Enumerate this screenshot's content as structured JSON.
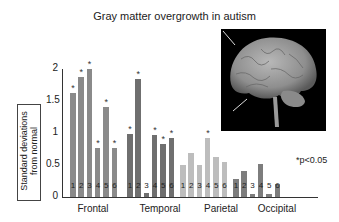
{
  "chart_data": {
    "type": "bar",
    "title": "Gray matter overgrowth in autism",
    "ylabel": "Standard deviations from normal",
    "xlabel": "",
    "ylim": [
      0,
      2
    ],
    "yticks": [
      "0",
      "0.5",
      "1",
      "1.5",
      "2"
    ],
    "annotation": "*p<0.05",
    "groups": [
      {
        "name": "Frontal",
        "color": "#8a8a8a",
        "labels": [
          "1",
          "2",
          "3",
          "4",
          "5",
          "6"
        ],
        "values": [
          1.62,
          1.87,
          2.0,
          0.77,
          1.4,
          0.77
        ],
        "significant": [
          true,
          true,
          true,
          true,
          true,
          true
        ]
      },
      {
        "name": "Temporal",
        "color": "#6f6f6f",
        "labels": [
          "1",
          "2",
          "3",
          "4",
          "5",
          "6"
        ],
        "values": [
          0.98,
          1.85,
          0.07,
          0.97,
          0.83,
          0.92
        ],
        "significant": [
          true,
          true,
          false,
          true,
          true,
          true
        ]
      },
      {
        "name": "Parietal",
        "color": "#bdbdbd",
        "labels": [
          "1",
          "2",
          "3",
          "4",
          "5",
          "6"
        ],
        "values": [
          0.5,
          0.68,
          0.5,
          0.92,
          0.62,
          0.55
        ],
        "significant": [
          false,
          false,
          false,
          true,
          false,
          false
        ]
      },
      {
        "name": "Occipital",
        "color": "#7d7d7d",
        "labels": [
          "1",
          "2",
          "3",
          "4",
          "5",
          "6"
        ],
        "values": [
          0.28,
          0.4,
          0.04,
          0.52,
          0.04,
          0.2
        ],
        "significant": [
          false,
          false,
          false,
          false,
          false,
          false
        ]
      }
    ]
  },
  "image": {
    "description": "Lateral view of a human brain with two arrows"
  }
}
